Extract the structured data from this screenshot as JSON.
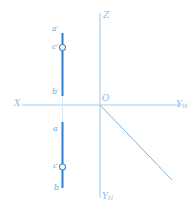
{
  "figure": {
    "background_color": "#ffffff",
    "axis_color": "#9fc9ea",
    "line_color": "#2f7fd0",
    "label_color": "#6aa9dd",
    "marker_fill": "#ffffff"
  },
  "axes": {
    "x_label": "X",
    "z_label": "Z",
    "yw_label": "Y",
    "yw_subscript": "W",
    "yh_label": "Y",
    "yh_subscript": "H",
    "origin_label": "O"
  },
  "points": [
    {
      "name": "a-prime",
      "label": "a",
      "prime": "′",
      "marker": "none"
    },
    {
      "name": "c-prime",
      "label": "c",
      "prime": "′",
      "marker": "circle"
    },
    {
      "name": "b-prime",
      "label": "b",
      "prime": "′",
      "marker": "none"
    },
    {
      "name": "a",
      "label": "a",
      "prime": "",
      "marker": "none"
    },
    {
      "name": "c",
      "label": "c",
      "prime": "",
      "marker": "circle"
    },
    {
      "name": "b",
      "label": "b",
      "prime": "",
      "marker": "none"
    }
  ],
  "labels": {
    "a_prime": "a′",
    "c_prime": "c′",
    "b_prime": "b′",
    "a": "a",
    "c": "c",
    "b": "b",
    "X": "X",
    "Z": "Z",
    "Y": "Y",
    "W": "W",
    "H": "H",
    "O": "O"
  }
}
